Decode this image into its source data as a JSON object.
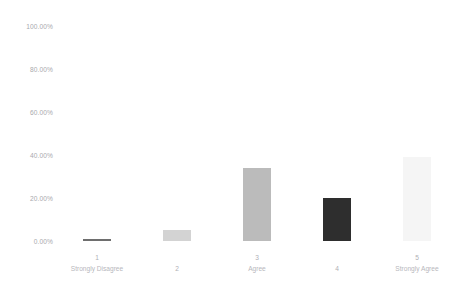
{
  "chart_data": {
    "type": "bar",
    "title": "",
    "xlabel": "",
    "ylabel": "",
    "ylim": [
      0,
      100
    ],
    "grid": false,
    "legend": "none",
    "y_ticks": [
      "0.00%",
      "20.00%",
      "40.00%",
      "60.00%",
      "80.00%",
      "100.00%"
    ],
    "y_tick_values": [
      0,
      20,
      40,
      60,
      80,
      100
    ],
    "categories": [
      "1",
      "2",
      "3",
      "4",
      "5"
    ],
    "category_names": [
      "Strongly Disagree",
      "",
      "Agree",
      "",
      "Strongly Agree"
    ],
    "values": [
      1,
      5,
      34,
      20,
      39
    ],
    "value_labels": [
      "1.00%",
      "5.00%",
      "34.00%",
      "20.00%",
      "39.00%"
    ],
    "bar_colors": [
      "#6e6e6e",
      "#d3d3d3",
      "#bbbbbb",
      "#2e2e2e",
      "#f5f5f5"
    ]
  },
  "axis": {
    "y_ticks": [
      {
        "label": "100.00%",
        "value": 100
      },
      {
        "label": "80.00%",
        "value": 80
      },
      {
        "label": "60.00%",
        "value": 60
      },
      {
        "label": "40.00%",
        "value": 40
      },
      {
        "label": "20.00%",
        "value": 20
      },
      {
        "label": "0.00%",
        "value": 0
      }
    ],
    "x_labels": [
      {
        "num": "1",
        "name": "Strongly Disagree"
      },
      {
        "num": "2",
        "name": ""
      },
      {
        "num": "3",
        "name": "Agree"
      },
      {
        "num": "4",
        "name": ""
      },
      {
        "num": "5",
        "name": "Strongly Agree"
      }
    ]
  },
  "colors": {
    "background": "#ffffff",
    "tick_text": "#a9a9ae",
    "label_text": "#b7b7bc"
  }
}
